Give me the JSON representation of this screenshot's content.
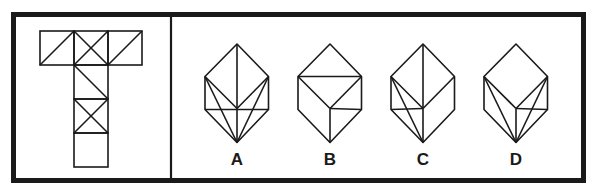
{
  "puzzle": {
    "frame": {
      "stroke": "#1a1a1a",
      "x": 13.5,
      "y": 14.5,
      "width": 570,
      "height": 166,
      "thickness": 5,
      "divider_x": 171
    },
    "net": {
      "description": "T-shaped cube net with diagonal markings",
      "square_size": 34,
      "squares": [
        {
          "x": 40,
          "y": 31,
          "marking": "diag-up"
        },
        {
          "x": 74,
          "y": 31,
          "marking": "x"
        },
        {
          "x": 108,
          "y": 31,
          "marking": "diag-up"
        },
        {
          "x": 74,
          "y": 65,
          "marking": "diag-down"
        },
        {
          "x": 74,
          "y": 99,
          "marking": "x"
        },
        {
          "x": 74,
          "y": 133,
          "marking": "none"
        }
      ]
    },
    "options": [
      {
        "label": "A",
        "cx": 237,
        "lines": [
          [
            "UL",
            "C"
          ],
          [
            "UR",
            "C"
          ],
          [
            "T",
            "C"
          ],
          [
            "C",
            "B"
          ],
          [
            "LL",
            "LR"
          ],
          [
            "UL",
            "B"
          ],
          [
            "UR",
            "B"
          ]
        ]
      },
      {
        "label": "B",
        "cx": 330,
        "lines": [
          [
            "UL",
            "UR"
          ],
          [
            "UL",
            "C"
          ],
          [
            "UR",
            "C"
          ],
          [
            "C",
            "B"
          ],
          [
            "C",
            "LR"
          ]
        ]
      },
      {
        "label": "C",
        "cx": 423,
        "lines": [
          [
            "T",
            "C"
          ],
          [
            "UL",
            "C"
          ],
          [
            "UR",
            "C"
          ],
          [
            "C",
            "B"
          ],
          [
            "LL",
            "C"
          ],
          [
            "UL",
            "B"
          ]
        ]
      },
      {
        "label": "D",
        "cx": 516,
        "lines": [
          [
            "UL",
            "C"
          ],
          [
            "UR",
            "C"
          ],
          [
            "C",
            "B"
          ],
          [
            "C",
            "LR"
          ],
          [
            "UL",
            "B"
          ],
          [
            "UR",
            "B"
          ]
        ]
      }
    ]
  }
}
